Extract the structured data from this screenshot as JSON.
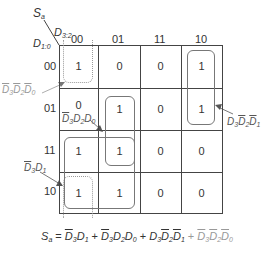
{
  "kmap": {
    "output_label": "S",
    "output_sub": "a",
    "col_var": "D",
    "col_var_sub": "3:2",
    "row_var": "D",
    "row_var_sub": "1:0",
    "col_headers": [
      "00",
      "01",
      "11",
      "10"
    ],
    "row_headers": [
      "00",
      "01",
      "11",
      "10"
    ],
    "cells": [
      [
        "1",
        "0",
        "0",
        "1"
      ],
      [
        "0",
        "1",
        "0",
        "1"
      ],
      [
        "1",
        "1",
        "0",
        "0"
      ],
      [
        "1",
        "1",
        "0",
        "0"
      ]
    ]
  },
  "groups": [
    {
      "term": "D̄3D̄2D̄0",
      "style": "dotted",
      "cells": "col 00, rows 00 & 10 (wrap)"
    },
    {
      "term": "D̄3D2D0",
      "style": "solid",
      "cells": "col 01, rows 01 & 11"
    },
    {
      "term": "D̄3D1",
      "style": "solid",
      "cells": "cols 00-01, rows 11 & 10"
    },
    {
      "term": "D3D̄2D̄1",
      "style": "solid",
      "cells": "col 10, rows 00 & 01"
    }
  ],
  "annotations": {
    "a1": {
      "D": "D",
      "s3": "3",
      "s2": "2",
      "s0": "0"
    },
    "a2": {
      "D": "D",
      "s3": "3",
      "s2": "2",
      "s0": "0"
    },
    "a3": {
      "D": "D",
      "s3": "3",
      "s1": "1"
    },
    "a4": {
      "D": "D",
      "s3": "3",
      "s2": "2",
      "s1": "1"
    }
  },
  "equation": {
    "lhs": "S",
    "lhs_sub": "a",
    "eq": " = ",
    "plus": " + ",
    "D": "D",
    "n0": "0",
    "n1": "1",
    "n2": "2",
    "n3": "3"
  }
}
